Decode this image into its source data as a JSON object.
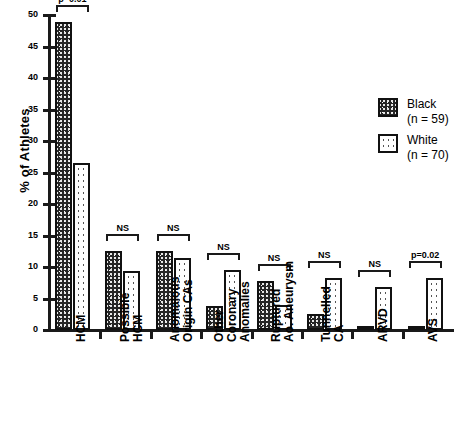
{
  "chart_data": {
    "type": "bar",
    "title": "",
    "xlabel": "",
    "ylabel": "% of Athletes",
    "ylim": [
      0,
      50
    ],
    "yticks": [
      0,
      5,
      10,
      15,
      20,
      25,
      30,
      35,
      40,
      45,
      50
    ],
    "grid": false,
    "legend_position": "upper-right",
    "categories": [
      "HCM",
      "Possible\nHCM",
      "Anomalous\nOrigin CAs",
      "Other\nCoronary\nAnomalies",
      "Ruptured\nAo. Aneurysm",
      "Tunnelled\nCA",
      "ARVD",
      "AVS"
    ],
    "series": [
      {
        "name": "Black",
        "n": 59,
        "legend_label": "Black",
        "legend_sublabel": "(n = 59)",
        "pattern": "dark-speckle",
        "values": [
          48.9,
          12.6,
          12.6,
          3.8,
          7.8,
          2.5,
          0.6,
          0.5
        ]
      },
      {
        "name": "White",
        "n": 70,
        "legend_label": "White",
        "legend_sublabel": "(n = 70)",
        "pattern": "light-dotted",
        "values": [
          26.5,
          9.4,
          11.5,
          9.5,
          4.0,
          8.3,
          6.8,
          8.3
        ]
      }
    ],
    "annotations": [
      "p=0.01",
      "NS",
      "NS",
      "NS",
      "NS",
      "NS",
      "NS",
      "p=0.02"
    ]
  },
  "colors": {
    "axis": "#1a1a1a",
    "bar_outline": "#111111",
    "black_series": "#262626",
    "white_series": "#ffffff",
    "background": "#ffffff"
  }
}
